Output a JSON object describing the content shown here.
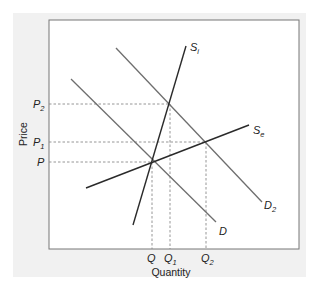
{
  "diagram": {
    "type": "supply-demand",
    "x_axis_label": "Quantity",
    "y_axis_label": "Price",
    "price_labels": [
      {
        "main": "P",
        "sub": "2"
      },
      {
        "main": "P",
        "sub": "1"
      },
      {
        "main": "P",
        "sub": ""
      }
    ],
    "quantity_labels": [
      {
        "main": "Q",
        "sub": ""
      },
      {
        "main": "Q",
        "sub": "1"
      },
      {
        "main": "Q",
        "sub": "2"
      }
    ],
    "curves": {
      "inelastic_supply": {
        "main": "S",
        "sub": "i"
      },
      "elastic_supply": {
        "main": "S",
        "sub": "e"
      },
      "demand": {
        "main": "D",
        "sub": ""
      },
      "demand_shifted": {
        "main": "D",
        "sub": "2"
      }
    },
    "colors": {
      "panel": "#f1f1f1",
      "plot_bg": "#ffffff",
      "supply": "#2a2a2a",
      "demand": "#6e6e6e",
      "guide": "#8a8a8a"
    }
  }
}
